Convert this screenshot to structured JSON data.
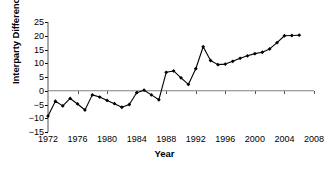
{
  "chart_data": {
    "type": "line",
    "title": "",
    "xlabel": "Year",
    "ylabel": "Interparty Difference",
    "xlim": [
      1972,
      2008
    ],
    "ylim": [
      -15,
      25
    ],
    "xticks": [
      1972,
      1976,
      1980,
      1984,
      1988,
      1992,
      1996,
      2000,
      2004,
      2008
    ],
    "yticks": [
      -15,
      -10,
      -5,
      0,
      5,
      10,
      15,
      20,
      25
    ],
    "grid": false,
    "legend": null,
    "marker": "diamond",
    "line_color": "#000000",
    "axis_color": "#808080",
    "series": [
      {
        "name": "Interparty Difference",
        "x": [
          1972,
          1973,
          1974,
          1975,
          1976,
          1977,
          1978,
          1979,
          1980,
          1981,
          1982,
          1983,
          1984,
          1985,
          1986,
          1987,
          1988,
          1989,
          1990,
          1991,
          1992,
          1993,
          1994,
          1995,
          1996,
          1997,
          1998,
          1999,
          2000,
          2001,
          2002,
          2003,
          2004,
          2005,
          2006
        ],
        "values": [
          -9.2,
          -3.8,
          -5.5,
          -2.8,
          -4.8,
          -7.0,
          -1.5,
          -2.3,
          -3.5,
          -4.7,
          -6.0,
          -5.0,
          -0.7,
          0.2,
          -1.5,
          -3.3,
          6.7,
          7.2,
          4.7,
          2.3,
          8.0,
          16.0,
          11.0,
          9.5,
          9.7,
          10.7,
          11.8,
          12.7,
          13.5,
          14.0,
          15.2,
          17.5,
          20.0,
          20.1,
          20.2
        ]
      }
    ]
  }
}
